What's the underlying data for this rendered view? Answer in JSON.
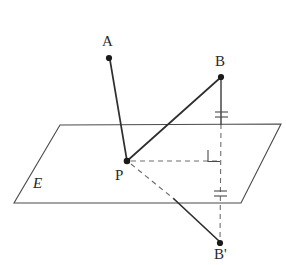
{
  "figure": {
    "background_color": "#ffffff",
    "stroke_color": "#3a3a3a",
    "dash_color": "#6b6b6b",
    "label_color": "#2a2a2a",
    "width": 286,
    "height": 265
  },
  "labels": {
    "point_a": "A",
    "point_b": "B",
    "point_p": "P",
    "point_b_prime": "B'",
    "plane_e": "E"
  },
  "points": {
    "A": {
      "x": 109,
      "y": 58
    },
    "B": {
      "x": 221,
      "y": 77
    },
    "P": {
      "x": 127,
      "y": 161
    },
    "B_prime": {
      "x": 220,
      "y": 243
    },
    "foot": {
      "x": 221,
      "y": 161
    }
  },
  "plane": {
    "name": "E",
    "corners": [
      {
        "x": 60,
        "y": 125
      },
      {
        "x": 281,
        "y": 124
      },
      {
        "x": 241,
        "y": 203
      },
      {
        "x": 14,
        "y": 203
      }
    ]
  },
  "segments": [
    {
      "name": "segment-PA",
      "from": "P",
      "to": "A",
      "style": "solid"
    },
    {
      "name": "segment-PB",
      "from": "P",
      "to": "B",
      "style": "solid"
    },
    {
      "name": "segment-B-to-plane",
      "from": "B",
      "to": "plane-crossing",
      "style": "solid"
    },
    {
      "name": "segment-plane-to-Bprime",
      "from": "plane-crossing",
      "to": "B_prime",
      "style": "dashed"
    },
    {
      "name": "segment-P-to-foot",
      "from": "P",
      "to": "foot",
      "style": "dashed"
    },
    {
      "name": "segment-P-to-Bprime-hidden",
      "from": "P",
      "to": "plane-front-edge",
      "style": "dashed"
    },
    {
      "name": "segment-P-to-Bprime-visible",
      "from": "plane-front-edge",
      "to": "B_prime",
      "style": "solid"
    }
  ],
  "marks": {
    "right_angle": {
      "x": 221,
      "y": 161,
      "label": "right-angle at foot of perpendicular"
    },
    "tick_upper": {
      "x": 221,
      "y": 115,
      "count": 2,
      "label": "equal length mark above plane"
    },
    "tick_lower": {
      "x": 221,
      "y": 194,
      "count": 2,
      "label": "equal length mark below plane"
    }
  }
}
